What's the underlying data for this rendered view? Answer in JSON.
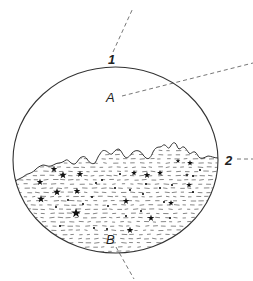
{
  "diagram": {
    "type": "cross-section",
    "colors": {
      "stroke": "#333333",
      "dash": "#666666",
      "fill_marks": "#111111",
      "background": "#ffffff"
    },
    "vessel": {
      "shape": "ellipse",
      "cx": 115.5,
      "cy": 160,
      "rx": 102.5,
      "ry": 93
    },
    "labels": {
      "label_1": "1",
      "label_2": "2",
      "label_A": "A",
      "label_B": "B"
    },
    "leader_lines": [
      {
        "id": "line-1",
        "from": [
          113,
          52
        ],
        "to": [
          133,
          8
        ]
      },
      {
        "id": "line-A",
        "from": [
          122,
          96
        ],
        "to": [
          253,
          63
        ]
      },
      {
        "id": "line-2",
        "from": [
          236,
          159
        ],
        "to": [
          253,
          159
        ]
      },
      {
        "id": "line-B",
        "from": [
          116,
          246
        ],
        "to": [
          134,
          278
        ]
      }
    ],
    "regions": [
      {
        "name": "upper-clear-region",
        "label": "A"
      },
      {
        "name": "lower-sediment-region",
        "label": "B",
        "pattern": "dashes-stars-dots"
      }
    ],
    "boundary": {
      "name": "wavy-surface",
      "label": "2"
    },
    "rim_point": {
      "name": "top-point",
      "label": "1"
    }
  }
}
